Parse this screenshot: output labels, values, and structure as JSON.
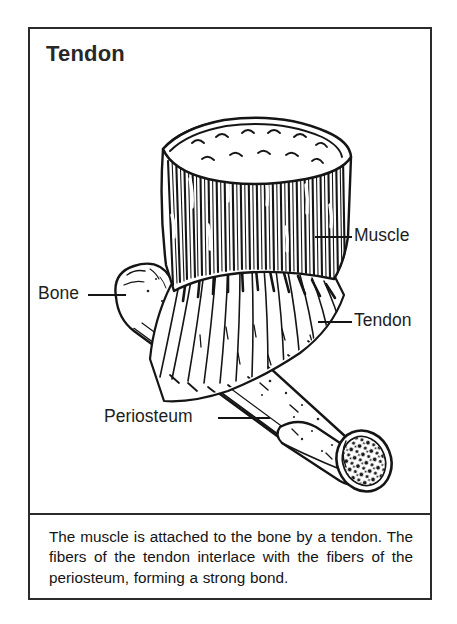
{
  "figure": {
    "title": "Tendon",
    "caption": "The muscle is attached to the bone by a tendon. The fibers of the tendon interlace with the fibers of the periosteum, forming a strong bond."
  },
  "labels": {
    "muscle": "Muscle",
    "tendon": "Tendon",
    "bone": "Bone",
    "periosteum": "Periosteum"
  },
  "illustration": {
    "type": "line-drawing",
    "subject": "muscle attaching to bone via tendon",
    "parts": [
      "cut muscle belly with striated fibers",
      "tendon fiber fan",
      "long bone shaft",
      "peeled periosteum flap",
      "cut bone end with trabecular marrow"
    ]
  },
  "colors": {
    "ink": "#151515",
    "border": "#2b2b2b",
    "background": "#ffffff",
    "text": "#1a1a1a"
  }
}
